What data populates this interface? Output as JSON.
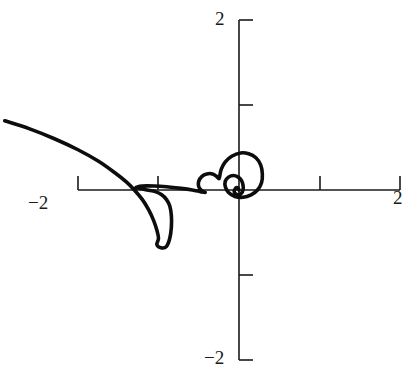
{
  "figure": {
    "background_color": "#ffffff",
    "curve_color": "#0d0d0d",
    "axis_color": "#1a1a1a"
  },
  "axes": {
    "origin_px": {
      "x": 239,
      "y": 190
    },
    "pixels_per_unit": 80.5,
    "x_tick_labels": [
      {
        "name": "x-left",
        "value": -2,
        "text": "−2"
      },
      {
        "name": "x-right",
        "value": 2,
        "text": "2"
      }
    ],
    "y_tick_labels": [
      {
        "name": "y-top",
        "value": 2,
        "text": "2"
      },
      {
        "name": "y-bottom",
        "value": -2,
        "text": "−2"
      }
    ]
  },
  "chart_data": {
    "type": "line",
    "title": "",
    "xlabel": "",
    "ylabel": "",
    "xlim": [
      -2.9,
      2.1
    ],
    "ylim": [
      -2.1,
      2.1
    ],
    "grid": false,
    "legend": "none",
    "xticks": [
      -2,
      -1,
      1,
      2
    ],
    "yticks": [
      -2,
      -1,
      1,
      2
    ],
    "xticklabels": [
      "−2",
      "",
      "",
      "2"
    ],
    "yticklabels": [
      "−2",
      "",
      "",
      "2"
    ],
    "series": [
      {
        "name": "spiral",
        "points": [
          [
            -2.91,
            0.86
          ],
          [
            -2.6,
            0.76
          ],
          [
            -2.3,
            0.64
          ],
          [
            -2.0,
            0.5
          ],
          [
            -1.75,
            0.36
          ],
          [
            -1.55,
            0.22
          ],
          [
            -1.4,
            0.1
          ],
          [
            -1.3,
            0.0
          ],
          [
            -1.2,
            -0.12
          ],
          [
            -1.12,
            -0.25
          ],
          [
            -1.06,
            -0.38
          ],
          [
            -1.02,
            -0.5
          ],
          [
            -1.0,
            -0.6
          ],
          [
            -1.02,
            -0.68
          ],
          [
            -0.96,
            -0.72
          ],
          [
            -0.9,
            -0.7
          ],
          [
            -0.86,
            -0.6
          ],
          [
            -0.84,
            -0.46
          ],
          [
            -0.84,
            -0.32
          ],
          [
            -0.86,
            -0.2
          ],
          [
            -0.9,
            -0.12
          ],
          [
            -0.96,
            -0.06
          ],
          [
            -1.04,
            -0.02
          ],
          [
            -1.14,
            0.0
          ],
          [
            -1.22,
            0.02
          ],
          [
            -1.28,
            0.03
          ],
          [
            -1.2,
            0.05
          ],
          [
            -1.05,
            0.05
          ],
          [
            -0.9,
            0.04
          ],
          [
            -0.72,
            0.02
          ],
          [
            -0.58,
            0.0
          ],
          [
            -0.48,
            -0.02
          ],
          [
            -0.42,
            -0.03
          ],
          [
            -0.46,
            -0.01
          ],
          [
            -0.5,
            0.04
          ],
          [
            -0.5,
            0.11
          ],
          [
            -0.46,
            0.17
          ],
          [
            -0.4,
            0.2
          ],
          [
            -0.33,
            0.2
          ],
          [
            -0.28,
            0.17
          ],
          [
            -0.25,
            0.14
          ],
          [
            -0.24,
            0.17
          ],
          [
            -0.22,
            0.26
          ],
          [
            -0.17,
            0.35
          ],
          [
            -0.09,
            0.42
          ],
          [
            0.02,
            0.46
          ],
          [
            0.12,
            0.45
          ],
          [
            0.21,
            0.4
          ],
          [
            0.27,
            0.31
          ],
          [
            0.29,
            0.2
          ],
          [
            0.28,
            0.09
          ],
          [
            0.23,
            0.0
          ],
          [
            0.15,
            -0.06
          ],
          [
            0.05,
            -0.09
          ],
          [
            -0.05,
            -0.08
          ],
          [
            -0.13,
            -0.03
          ],
          [
            -0.17,
            0.04
          ],
          [
            -0.17,
            0.11
          ],
          [
            -0.13,
            0.16
          ],
          [
            -0.07,
            0.18
          ],
          [
            -0.01,
            0.16
          ],
          [
            0.03,
            0.12
          ],
          [
            0.05,
            0.06
          ],
          [
            0.05,
            0.0
          ],
          [
            0.03,
            -0.04
          ],
          [
            -0.01,
            -0.06
          ],
          [
            -0.04,
            -0.05
          ],
          [
            -0.06,
            -0.02
          ],
          [
            -0.05,
            0.01
          ],
          [
            -0.03,
            0.03
          ],
          [
            -0.01,
            0.02
          ],
          [
            0.0,
            0.0
          ]
        ]
      }
    ]
  }
}
